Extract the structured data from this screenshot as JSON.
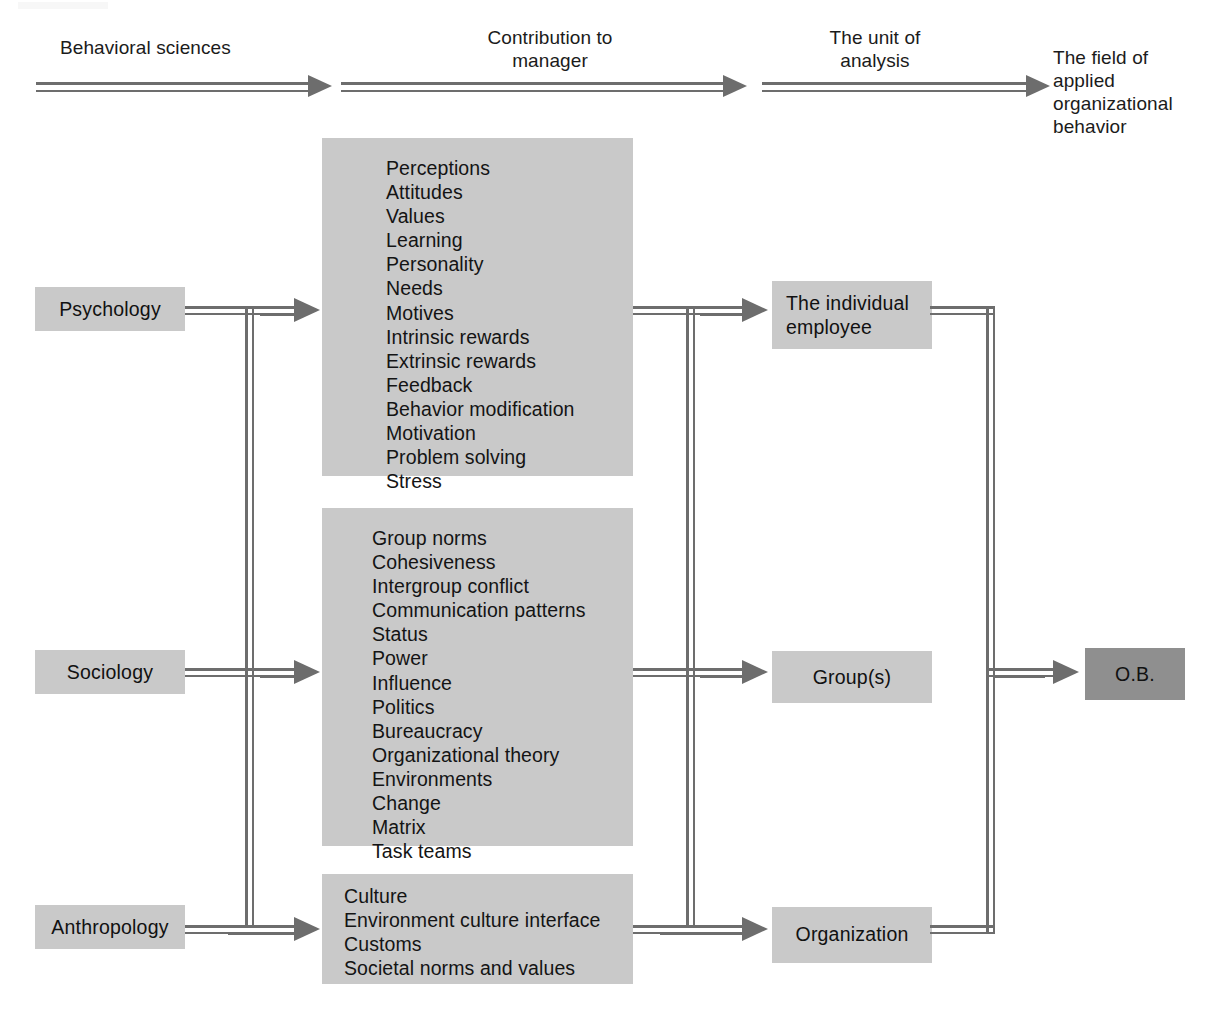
{
  "figure": {
    "background": "#ffffff",
    "box_fill": "#c9c9c9",
    "box_fill_dark": "#8f8f8f",
    "rule_color": "#6d6d6d",
    "text_color": "#111111"
  },
  "header": {
    "col1": "Behavioral sciences",
    "col2": "Contribution to\nmanager",
    "col3": "The unit of\nanalysis",
    "col4": "The field of\napplied\norganizational\nbehavior"
  },
  "disciplines": [
    {
      "label": "Psychology"
    },
    {
      "label": "Sociology"
    },
    {
      "label": "Anthropology"
    }
  ],
  "contributions": {
    "psychology": [
      "Perceptions",
      "Attitudes",
      "Values",
      "Learning",
      "Personality",
      "Needs",
      "Motives",
      "Intrinsic rewards",
      "Extrinsic rewards",
      "Feedback",
      "Behavior modification",
      "Motivation",
      "Problem solving",
      "Stress"
    ],
    "sociology": [
      "Group norms",
      "Cohesiveness",
      "Intergroup conflict",
      "Communication patterns",
      "Status",
      "Power",
      "Influence",
      "Politics",
      "Bureaucracy",
      "Organizational theory",
      "Environments",
      "Change",
      "Matrix",
      "Task teams"
    ],
    "anthropology": [
      "Culture",
      "Environment culture interface",
      "Customs",
      "Societal norms and values"
    ]
  },
  "units_of_analysis": [
    {
      "label": "The individual\nemployee"
    },
    {
      "label": "Group(s)"
    },
    {
      "label": "Organization"
    }
  ],
  "outcome": {
    "label": "O.B."
  }
}
